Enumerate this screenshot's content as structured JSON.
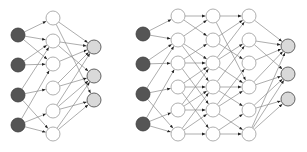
{
  "diagram": {
    "colors": {
      "input": "#555555",
      "hidden": "#ffffff",
      "output": "#d9d9d9",
      "edge": "#8a8a8a"
    },
    "node_radius": 7,
    "networks": [
      {
        "name": "shallow-network",
        "layers": [
          {
            "type": "input",
            "x": 18,
            "ys": [
              35,
              65,
              95,
              125
            ]
          },
          {
            "type": "hidden",
            "x": 53,
            "ys": [
              18,
              41,
              64,
              88,
              111,
              134
            ]
          },
          {
            "type": "output",
            "x": 94,
            "ys": [
              47,
              76,
              100
            ]
          }
        ],
        "edges": [
          [
            [
              0,
              0
            ],
            [
              1,
              0
            ]
          ],
          [
            [
              0,
              0
            ],
            [
              1,
              1
            ]
          ],
          [
            [
              0,
              0
            ],
            [
              1,
              2
            ]
          ],
          [
            [
              0,
              1
            ],
            [
              1,
              1
            ]
          ],
          [
            [
              0,
              1
            ],
            [
              1,
              2
            ]
          ],
          [
            [
              0,
              2
            ],
            [
              1,
              1
            ]
          ],
          [
            [
              0,
              2
            ],
            [
              1,
              3
            ]
          ],
          [
            [
              0,
              2
            ],
            [
              1,
              5
            ]
          ],
          [
            [
              0,
              3
            ],
            [
              1,
              2
            ]
          ],
          [
            [
              0,
              3
            ],
            [
              1,
              4
            ]
          ],
          [
            [
              0,
              3
            ],
            [
              1,
              5
            ]
          ],
          [
            [
              1,
              0
            ],
            [
              2,
              0
            ]
          ],
          [
            [
              1,
              0
            ],
            [
              2,
              2
            ]
          ],
          [
            [
              1,
              1
            ],
            [
              2,
              0
            ]
          ],
          [
            [
              1,
              1
            ],
            [
              2,
              1
            ]
          ],
          [
            [
              1,
              2
            ],
            [
              2,
              0
            ]
          ],
          [
            [
              1,
              3
            ],
            [
              2,
              0
            ]
          ],
          [
            [
              1,
              3
            ],
            [
              2,
              1
            ]
          ],
          [
            [
              1,
              4
            ],
            [
              2,
              0
            ]
          ],
          [
            [
              1,
              4
            ],
            [
              2,
              1
            ]
          ],
          [
            [
              1,
              4
            ],
            [
              2,
              2
            ]
          ],
          [
            [
              1,
              5
            ],
            [
              2,
              1
            ]
          ],
          [
            [
              1,
              5
            ],
            [
              2,
              2
            ]
          ]
        ]
      },
      {
        "name": "deep-network",
        "layers": [
          {
            "type": "input",
            "x": 143,
            "ys": [
              34,
              64,
              94,
              124
            ]
          },
          {
            "type": "hidden",
            "x": 178,
            "ys": [
              16,
              40,
              63,
              87,
              110,
              134
            ]
          },
          {
            "type": "hidden",
            "x": 213,
            "ys": [
              16,
              40,
              63,
              87,
              110,
              134
            ]
          },
          {
            "type": "hidden",
            "x": 249,
            "ys": [
              16,
              40,
              63,
              87,
              110,
              134
            ]
          },
          {
            "type": "output",
            "x": 288,
            "ys": [
              46,
              74,
              99
            ]
          }
        ],
        "edges": [
          [
            [
              0,
              0
            ],
            [
              1,
              0
            ]
          ],
          [
            [
              0,
              0
            ],
            [
              1,
              1
            ]
          ],
          [
            [
              0,
              1
            ],
            [
              1,
              1
            ]
          ],
          [
            [
              0,
              1
            ],
            [
              1,
              2
            ]
          ],
          [
            [
              0,
              2
            ],
            [
              1,
              1
            ]
          ],
          [
            [
              0,
              2
            ],
            [
              1,
              3
            ]
          ],
          [
            [
              0,
              2
            ],
            [
              1,
              5
            ]
          ],
          [
            [
              0,
              3
            ],
            [
              1,
              2
            ]
          ],
          [
            [
              0,
              3
            ],
            [
              1,
              4
            ]
          ],
          [
            [
              0,
              3
            ],
            [
              1,
              5
            ]
          ],
          [
            [
              1,
              0
            ],
            [
              2,
              0
            ]
          ],
          [
            [
              1,
              0
            ],
            [
              2,
              1
            ]
          ],
          [
            [
              1,
              1
            ],
            [
              2,
              0
            ]
          ],
          [
            [
              1,
              1
            ],
            [
              2,
              2
            ]
          ],
          [
            [
              1,
              1
            ],
            [
              2,
              3
            ]
          ],
          [
            [
              1,
              2
            ],
            [
              2,
              1
            ]
          ],
          [
            [
              1,
              2
            ],
            [
              2,
              2
            ]
          ],
          [
            [
              1,
              2
            ],
            [
              2,
              4
            ]
          ],
          [
            [
              1,
              3
            ],
            [
              2,
              2
            ]
          ],
          [
            [
              1,
              3
            ],
            [
              2,
              3
            ]
          ],
          [
            [
              1,
              3
            ],
            [
              2,
              5
            ]
          ],
          [
            [
              1,
              4
            ],
            [
              2,
              2
            ]
          ],
          [
            [
              1,
              4
            ],
            [
              2,
              3
            ]
          ],
          [
            [
              1,
              4
            ],
            [
              2,
              4
            ]
          ],
          [
            [
              1,
              5
            ],
            [
              2,
              3
            ]
          ],
          [
            [
              1,
              5
            ],
            [
              2,
              4
            ]
          ],
          [
            [
              1,
              5
            ],
            [
              2,
              5
            ]
          ],
          [
            [
              2,
              0
            ],
            [
              3,
              0
            ]
          ],
          [
            [
              2,
              0
            ],
            [
              3,
              3
            ]
          ],
          [
            [
              2,
              1
            ],
            [
              3,
              0
            ]
          ],
          [
            [
              2,
              1
            ],
            [
              3,
              2
            ]
          ],
          [
            [
              2,
              2
            ],
            [
              3,
              0
            ]
          ],
          [
            [
              2,
              2
            ],
            [
              3,
              1
            ]
          ],
          [
            [
              2,
              2
            ],
            [
              3,
              3
            ]
          ],
          [
            [
              2,
              3
            ],
            [
              3,
              1
            ]
          ],
          [
            [
              2,
              3
            ],
            [
              3,
              3
            ]
          ],
          [
            [
              2,
              3
            ],
            [
              3,
              4
            ]
          ],
          [
            [
              2,
              4
            ],
            [
              3,
              2
            ]
          ],
          [
            [
              2,
              4
            ],
            [
              3,
              3
            ]
          ],
          [
            [
              2,
              4
            ],
            [
              3,
              5
            ]
          ],
          [
            [
              2,
              5
            ],
            [
              3,
              4
            ]
          ],
          [
            [
              2,
              5
            ],
            [
              3,
              5
            ]
          ],
          [
            [
              3,
              0
            ],
            [
              4,
              0
            ]
          ],
          [
            [
              3,
              1
            ],
            [
              4,
              0
            ]
          ],
          [
            [
              3,
              1
            ],
            [
              4,
              1
            ]
          ],
          [
            [
              3,
              2
            ],
            [
              4,
              0
            ]
          ],
          [
            [
              3,
              3
            ],
            [
              4,
              0
            ]
          ],
          [
            [
              3,
              3
            ],
            [
              4,
              1
            ]
          ],
          [
            [
              3,
              4
            ],
            [
              4,
              1
            ]
          ],
          [
            [
              3,
              4
            ],
            [
              4,
              2
            ]
          ],
          [
            [
              3,
              5
            ],
            [
              4,
              0
            ]
          ],
          [
            [
              3,
              5
            ],
            [
              4,
              1
            ]
          ],
          [
            [
              3,
              5
            ],
            [
              4,
              2
            ]
          ]
        ]
      }
    ]
  }
}
